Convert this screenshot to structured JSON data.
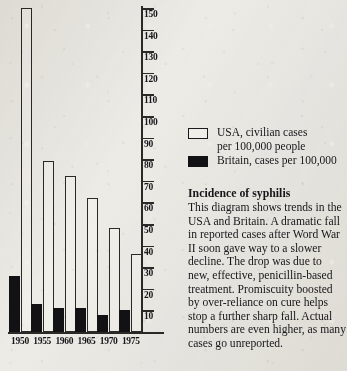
{
  "chart_data": {
    "type": "bar",
    "title": "Incidence of syphilis",
    "xlabel": "",
    "ylabel": "",
    "ylim": [
      0,
      150
    ],
    "grid": false,
    "legend_position": "right",
    "categories": [
      "1950",
      "1955",
      "1960",
      "1965",
      "1970",
      "1975"
    ],
    "yticks": [
      10,
      20,
      30,
      40,
      50,
      60,
      70,
      80,
      90,
      100,
      110,
      120,
      130,
      140,
      150
    ],
    "series": [
      {
        "name": "USA, civilian cases per 100,000 people",
        "short_name": "USA",
        "style": "open",
        "color": "#f3f2ee",
        "edge_color": "#2b2a28",
        "values": [
          150,
          79,
          72,
          62,
          48,
          36
        ]
      },
      {
        "name": "Britain, cases per 100,000",
        "short_name": "Britain",
        "style": "solid",
        "color": "#121113",
        "edge_color": "#121113",
        "values": [
          26,
          13,
          11,
          11,
          8,
          10
        ]
      }
    ]
  },
  "legend": {
    "items": [
      {
        "swatch": "open",
        "line1": "USA, civilian cases",
        "line2": "per 100,000 people"
      },
      {
        "swatch": "solid",
        "line1": "Britain, cases per 100,000",
        "line2": ""
      }
    ]
  },
  "article": {
    "heading": "Incidence of syphilis",
    "body": "This diagram shows trends in the USA and Britain. A dramatic fall in reported cases after Word War II soon gave way to a slower decline. The drop was due to new, effective, penicillin-based treatment. Promiscuity boosted by over-reliance on cure helps stop a further sharp fall. Actual numbers are even higher, as many cases go unreported."
  }
}
